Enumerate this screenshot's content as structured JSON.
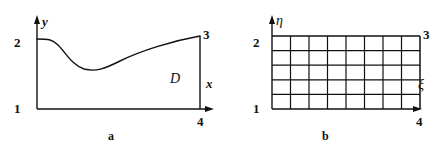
{
  "figure": {
    "panels": [
      {
        "id": "a",
        "caption": "a",
        "axes": {
          "x_label": "x",
          "y_label": "y"
        },
        "corner_labels": {
          "origin": "1",
          "top_left": "2",
          "top_right": "3",
          "bottom_right": "4"
        },
        "region_label": "D",
        "description": "physical domain D bounded below by horizontal line 1-4, left by vertical segment 1-2, right by vertical segment 4-3, and above by a curved boundary from 2 to 3"
      },
      {
        "id": "b",
        "caption": "b",
        "axes": {
          "x_label": "ξ",
          "y_label": "η"
        },
        "corner_labels": {
          "origin": "1",
          "top_left": "2",
          "top_right": "3",
          "bottom_right": "4"
        },
        "grid": {
          "columns": 8,
          "rows": 5
        },
        "description": "computational rectangle in xi-eta coordinates subdivided by a uniform mesh"
      }
    ]
  },
  "colors": {
    "ink": "#111111",
    "background": "#ffffff"
  }
}
